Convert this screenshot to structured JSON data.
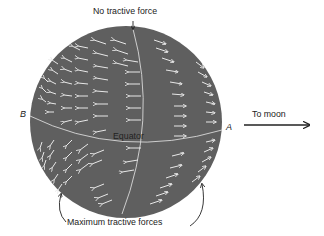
{
  "diagram": {
    "type": "tidal tractive forces on Earth sphere",
    "labels": {
      "top": "No tractive force",
      "bottom": "Maximum tractive forces",
      "equator": "Equator",
      "point_a": "A",
      "point_b": "B",
      "direction": "To moon"
    },
    "colors": {
      "sphere": "#5f5f5f",
      "arrows": "#e8e8e8",
      "lines": "#d9d9d9",
      "text": "#222222",
      "background": "#ffffff"
    },
    "arrow_fields": {
      "left_hemisphere_direction": "toward B (away from moon)",
      "right_hemisphere_direction": "toward A (toward moon)"
    }
  }
}
